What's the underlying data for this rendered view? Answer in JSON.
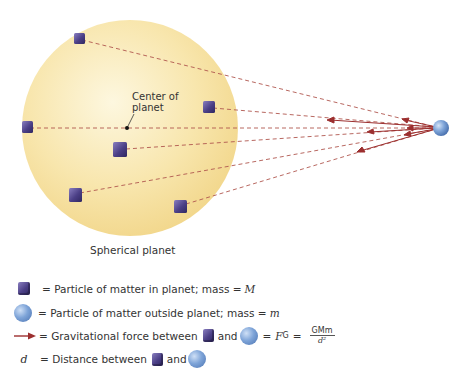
{
  "diagram": {
    "planet_label": "Spherical planet",
    "center_label_line1": "Center of",
    "center_label_line2": "planet",
    "colors": {
      "planet_fill": "#f6e3a6",
      "planet_highlight": "#fdf6dc",
      "line_color": "#a33a3a",
      "cube": "#4b3f86",
      "sphere": "#7ea4d8"
    },
    "planet": {
      "cx": 130,
      "cy": 128,
      "r": 108
    },
    "center_point": {
      "x": 127,
      "y": 128
    },
    "external_particle": {
      "x": 441,
      "y": 128,
      "r": 8
    },
    "internal_particles": [
      {
        "x": 78,
        "y": 38
      },
      {
        "x": 208,
        "y": 107
      },
      {
        "x": 27,
        "y": 127
      },
      {
        "x": 120,
        "y": 150
      },
      {
        "x": 75,
        "y": 195
      },
      {
        "x": 180,
        "y": 206
      }
    ]
  },
  "legend": {
    "cube_text": "= Particle of matter in planet; mass = ",
    "cube_var": "M",
    "sphere_text": "= Particle of matter outside planet; mass = ",
    "sphere_var": "m",
    "arrow_text": "= Gravitational force between",
    "and_text": "and",
    "equals_text": "=",
    "force_symbol": "F",
    "force_subscript": "G",
    "equals2_text": "=",
    "formula_numerator": "GMm",
    "formula_denominator": "d²",
    "d_symbol": "d",
    "d_text": "= Distance between",
    "d_and_text": "and"
  }
}
